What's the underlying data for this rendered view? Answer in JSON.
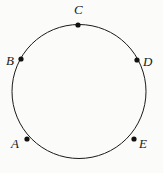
{
  "figure": {
    "name": "circle-with-five-points",
    "background_color": "#fbfbfa",
    "stroke_color": "#1a1a1a",
    "point_color": "#111111",
    "label_color": "#1a1a1a"
  },
  "circle": {
    "center_x": 79,
    "center_y": 91.5,
    "radius": 67,
    "stroke_width": 1
  },
  "points": [
    {
      "label": "A",
      "dot_x": 27,
      "dot_y": 139,
      "dot_radius": 2.6,
      "label_x": 11,
      "label_y": 137
    },
    {
      "label": "B",
      "dot_x": 21,
      "dot_y": 59,
      "dot_radius": 2.6,
      "label_x": 6,
      "label_y": 54
    },
    {
      "label": "C",
      "dot_x": 78,
      "dot_y": 25,
      "dot_radius": 2.6,
      "label_x": 74,
      "label_y": 3
    },
    {
      "label": "D",
      "dot_x": 137,
      "dot_y": 60,
      "dot_radius": 2.6,
      "label_x": 143,
      "label_y": 55
    },
    {
      "label": "E",
      "dot_x": 134,
      "dot_y": 139,
      "dot_radius": 2.6,
      "label_x": 139,
      "label_y": 137
    }
  ]
}
